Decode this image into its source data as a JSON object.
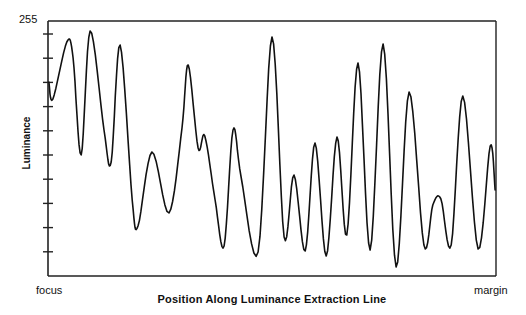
{
  "chart_data": {
    "type": "line",
    "title": "",
    "xlabel": "Position Along Luminance Extraction Line",
    "ylabel": "Luminance",
    "x_tick_labels": {
      "start": "focus",
      "end": "margin"
    },
    "y_tick_labels": {
      "max": "255"
    },
    "ylim": [
      0,
      255
    ],
    "xlim": [
      0,
      1
    ],
    "y_minor_ticks": 10,
    "grid": false,
    "legend": null,
    "series": [
      {
        "name": "Luminance profile",
        "color": "#111111",
        "x": [
          0.002,
          0.011,
          0.042,
          0.056,
          0.074,
          0.094,
          0.125,
          0.141,
          0.161,
          0.188,
          0.201,
          0.232,
          0.27,
          0.299,
          0.313,
          0.335,
          0.35,
          0.373,
          0.393,
          0.413,
          0.431,
          0.469,
          0.5,
          0.527,
          0.549,
          0.574,
          0.596,
          0.621,
          0.645,
          0.667,
          0.692,
          0.719,
          0.748,
          0.777,
          0.806,
          0.839,
          0.859,
          0.877,
          0.9,
          0.926,
          0.96,
          0.987,
          0.998
        ],
        "values": [
          194,
          177,
          234,
          218,
          121,
          245,
          146,
          114,
          231,
          76,
          50,
          124,
          63,
          148,
          211,
          128,
          140,
          76,
          30,
          146,
          99,
          24,
          239,
          39,
          101,
          25,
          133,
          20,
          139,
          41,
          213,
          26,
          232,
          9,
          184,
          31,
          71,
          77,
          31,
          180,
          27,
          130,
          86
        ]
      }
    ]
  },
  "labels": {
    "y_max": "255",
    "y_axis": "Luminance",
    "x_start": "focus",
    "x_end": "margin",
    "x_axis": "Position Along Luminance Extraction Line"
  }
}
